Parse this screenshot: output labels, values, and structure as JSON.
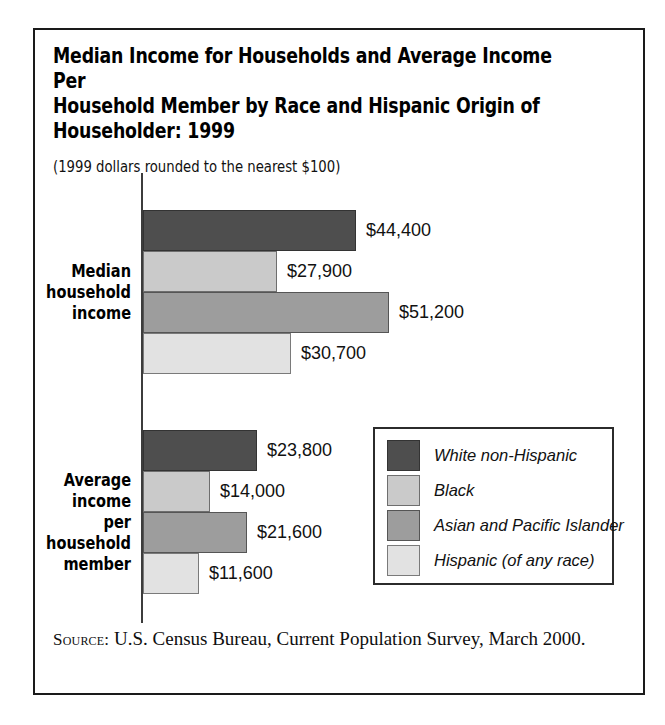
{
  "figure": {
    "title": "Median Income for Households and Average Income Per\nHousehold Member by Race and Hispanic Origin of\nHouseholder: 1999",
    "subtitle": "(1999 dollars rounded to the nearest $100)",
    "source_label": "Source:",
    "source_text": "U.S. Census Bureau, Current Population Survey, March 2000."
  },
  "legend": {
    "entries": [
      {
        "label": "White non-Hispanic",
        "swatch": "swatch-dark",
        "color": "#4e4e4e"
      },
      {
        "label": "Black",
        "swatch": "swatch-light",
        "color": "#cacaca"
      },
      {
        "label": "Asian and Pacific Islander",
        "swatch": "swatch-mid",
        "color": "#9d9d9d"
      },
      {
        "label": "Hispanic (of any race)",
        "swatch": "swatch-pale",
        "color": "#e2e2e2"
      }
    ]
  },
  "chart_data": {
    "type": "bar",
    "orientation": "horizontal",
    "title": "Median Income for Households and Average Income Per Household Member by Race and Hispanic Origin of Householder: 1999",
    "subtitle": "(1999 dollars rounded to the nearest $100)",
    "xlabel": "",
    "ylabel": "",
    "xlim": [
      0,
      51200
    ],
    "grid": false,
    "legend_position": "inside-right",
    "categories": [
      "Median household income",
      "Average income per household member"
    ],
    "series": [
      {
        "name": "White non-Hispanic",
        "color": "#4e4e4e",
        "values": [
          44400,
          23800
        ],
        "labels": [
          "$44,400",
          "$23,800"
        ]
      },
      {
        "name": "Black",
        "color": "#cacaca",
        "values": [
          27900,
          14000
        ],
        "labels": [
          "$27,900",
          "$14,000"
        ]
      },
      {
        "name": "Asian and Pacific Islander",
        "color": "#9d9d9d",
        "values": [
          51200,
          21600
        ],
        "labels": [
          "$51,200",
          "$21,600"
        ]
      },
      {
        "name": "Hispanic (of any race)",
        "color": "#e2e2e2",
        "values": [
          30700,
          11600
        ],
        "labels": [
          "$30,700",
          "$11,600"
        ]
      }
    ],
    "groups": [
      {
        "label": "Median\nhousehold\nincome",
        "bars": [
          {
            "series": "White non-Hispanic",
            "value": 44400,
            "label": "$44,400",
            "swatch": "swatch-dark"
          },
          {
            "series": "Black",
            "value": 27900,
            "label": "$27,900",
            "swatch": "swatch-light"
          },
          {
            "series": "Asian and Pacific Islander",
            "value": 51200,
            "label": "$51,200",
            "swatch": "swatch-mid"
          },
          {
            "series": "Hispanic (of any race)",
            "value": 30700,
            "label": "$30,700",
            "swatch": "swatch-pale"
          }
        ]
      },
      {
        "label": "Average\nincome per\nhousehold\nmember",
        "bars": [
          {
            "series": "White non-Hispanic",
            "value": 23800,
            "label": "$23,800",
            "swatch": "swatch-dark"
          },
          {
            "series": "Black",
            "value": 14000,
            "label": "$14,000",
            "swatch": "swatch-light"
          },
          {
            "series": "Asian and Pacific Islander",
            "value": 21600,
            "label": "$21,600",
            "swatch": "swatch-mid"
          },
          {
            "series": "Hispanic (of any race)",
            "value": 11600,
            "label": "$11,600",
            "swatch": "swatch-pale"
          }
        ]
      }
    ]
  }
}
